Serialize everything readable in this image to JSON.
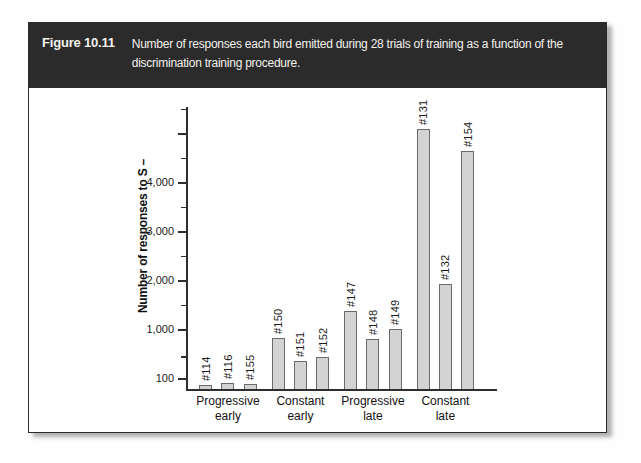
{
  "figure_header": {
    "label": "Figure 10.11",
    "caption": "Number of responses each bird emitted during 28 trials of training as a function of the discrimination training procedure.",
    "bg_color": "#2b2b2b",
    "text_color": "#f2f1ec"
  },
  "chart_data": {
    "type": "bar",
    "title": "",
    "xlabel": "",
    "ylabel": "Number of responses to S –",
    "ylim": [
      0,
      5500
    ],
    "grid": false,
    "legend": "none",
    "axis_note": "ordinate compressed below 100; unlabeled ticks every 500",
    "y_axis": {
      "ticks": [
        {
          "value": 100,
          "label": "100",
          "major": true
        },
        {
          "value": 500,
          "major": false
        },
        {
          "value": 1000,
          "label": "1,000",
          "major": true
        },
        {
          "value": 1500,
          "major": false
        },
        {
          "value": 2000,
          "label": "2,000",
          "major": true
        },
        {
          "value": 2500,
          "major": false
        },
        {
          "value": 3000,
          "label": "3,000",
          "major": true
        },
        {
          "value": 3500,
          "major": false
        },
        {
          "value": 4000,
          "label": "4,000",
          "major": true
        },
        {
          "value": 4500,
          "major": false
        },
        {
          "value": 5000,
          "major": true
        },
        {
          "value": 5500,
          "major": false
        }
      ]
    },
    "groups": [
      {
        "label_line1": "Progressive",
        "label_line2": "early",
        "bars": [
          {
            "bird": "#114",
            "value": 35
          },
          {
            "bird": "#116",
            "value": 60
          },
          {
            "bird": "#155",
            "value": 50
          }
        ]
      },
      {
        "label_line1": "Constant",
        "label_line2": "early",
        "bars": [
          {
            "bird": "#150",
            "value": 850
          },
          {
            "bird": "#151",
            "value": 430
          },
          {
            "bird": "#152",
            "value": 500
          }
        ]
      },
      {
        "label_line1": "Progressive",
        "label_line2": "late",
        "bars": [
          {
            "bird": "#147",
            "value": 1390
          },
          {
            "bird": "#148",
            "value": 840
          },
          {
            "bird": "#149",
            "value": 1020
          }
        ]
      },
      {
        "label_line1": "Constant",
        "label_line2": "late",
        "bars": [
          {
            "bird": "#131",
            "value": 5100
          },
          {
            "bird": "#132",
            "value": 1930
          },
          {
            "bird": "#154",
            "value": 4650
          }
        ]
      }
    ],
    "colors": {
      "bar_fill": "#d3d3d3",
      "bar_border": "#6a6a6a",
      "axis": "#2e2e2e"
    }
  }
}
